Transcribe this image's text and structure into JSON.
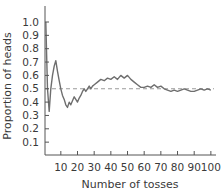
{
  "chart_data": {
    "type": "line",
    "title": "",
    "xlabel": "Number of tosses",
    "ylabel": "Proportion of heads",
    "xlim": [
      0,
      102
    ],
    "ylim": [
      0,
      1.1
    ],
    "grid": false,
    "legend": null,
    "x_ticks": [
      10,
      20,
      30,
      40,
      50,
      60,
      70,
      80,
      90,
      100
    ],
    "y_ticks": [
      0.1,
      0.2,
      0.3,
      0.4,
      0.5,
      0.6,
      0.7,
      0.8,
      0.9,
      1.0
    ],
    "reference_line": {
      "y": 0.5,
      "style": "dashed",
      "color": "#9a9a9a"
    },
    "series": [
      {
        "name": "Proportion of heads",
        "color": "#6e6e6e",
        "x": [
          1,
          2,
          3,
          4,
          5,
          6,
          7,
          8,
          9,
          10,
          11,
          12,
          13,
          14,
          15,
          16,
          17,
          18,
          19,
          20,
          21,
          22,
          23,
          24,
          25,
          26,
          27,
          28,
          29,
          30,
          32,
          34,
          36,
          38,
          40,
          42,
          44,
          46,
          48,
          50,
          52,
          54,
          56,
          58,
          60,
          62,
          64,
          66,
          68,
          70,
          72,
          74,
          76,
          78,
          80,
          82,
          84,
          86,
          88,
          90,
          92,
          94,
          96,
          98,
          100
        ],
        "values": [
          1.0,
          0.5,
          0.33,
          0.5,
          0.6,
          0.67,
          0.71,
          0.63,
          0.56,
          0.5,
          0.45,
          0.42,
          0.38,
          0.36,
          0.4,
          0.38,
          0.41,
          0.44,
          0.42,
          0.4,
          0.43,
          0.45,
          0.48,
          0.5,
          0.48,
          0.5,
          0.52,
          0.5,
          0.52,
          0.53,
          0.55,
          0.57,
          0.56,
          0.58,
          0.57,
          0.59,
          0.57,
          0.6,
          0.58,
          0.6,
          0.57,
          0.55,
          0.53,
          0.51,
          0.51,
          0.52,
          0.51,
          0.53,
          0.51,
          0.52,
          0.5,
          0.49,
          0.48,
          0.49,
          0.48,
          0.49,
          0.5,
          0.49,
          0.48,
          0.48,
          0.49,
          0.5,
          0.49,
          0.5,
          0.49
        ]
      }
    ]
  }
}
